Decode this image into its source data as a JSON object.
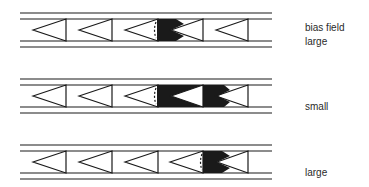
{
  "labels": {
    "row1_line1": "bias  field",
    "row1_line2": "large",
    "row2": "small",
    "row3": "large"
  },
  "colors": {
    "ink": "#1a1a1a",
    "background": "#ffffff"
  },
  "rows": [
    {
      "bias_field": "large",
      "wall_cell": 3,
      "black_width": "narrow"
    },
    {
      "bias_field": "small",
      "wall_cell": 3,
      "black_width": "wide"
    },
    {
      "bias_field": "large",
      "wall_cell": 4,
      "black_width": "narrow"
    }
  ]
}
